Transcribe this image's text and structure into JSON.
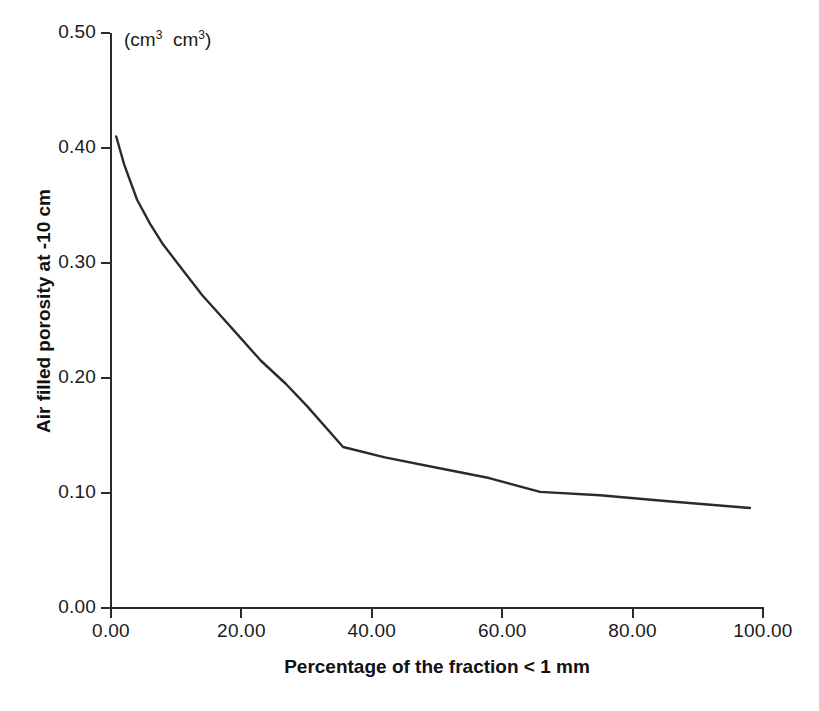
{
  "chart_data": {
    "type": "line",
    "title": "",
    "subtitle": "",
    "units_annotation": "(cm3 cm3)",
    "xlabel": "Percentage of the fraction < 1 mm",
    "ylabel": "Air filled porosity at -10 cm",
    "xlim": [
      0.0,
      100.0
    ],
    "ylim": [
      0.0,
      0.5
    ],
    "xticks": [
      "0.00",
      "20.00",
      "40.00",
      "60.00",
      "80.00",
      "100.00"
    ],
    "xtick_values": [
      0,
      20,
      40,
      60,
      80,
      100
    ],
    "yticks": [
      "0.00",
      "0.10",
      "0.20",
      "0.30",
      "0.40",
      "0.50"
    ],
    "ytick_values": [
      0.0,
      0.1,
      0.2,
      0.3,
      0.4,
      0.5
    ],
    "grid": false,
    "legend": "none",
    "series": [
      {
        "name": "Air filled porosity",
        "color": "#2b2b2b",
        "x": [
          0.8,
          2.0,
          4.0,
          6.0,
          8.0,
          11.0,
          14.0,
          17.0,
          20.0,
          23.0,
          26.8,
          30.0,
          35.6,
          42.0,
          50.0,
          58.0,
          65.8,
          75.0,
          85.0,
          98.0
        ],
        "y": [
          0.41,
          0.386,
          0.355,
          0.334,
          0.316,
          0.294,
          0.272,
          0.253,
          0.234,
          0.215,
          0.195,
          0.176,
          0.14,
          0.131,
          0.122,
          0.113,
          0.101,
          0.098,
          0.093,
          0.087
        ]
      }
    ]
  },
  "figure": {
    "background_color": "#ffffff",
    "line_color": "#2b2b2b",
    "axis_color": "#2b2b2b",
    "text_color": "#1a1a1a"
  },
  "caption_fragment": ""
}
